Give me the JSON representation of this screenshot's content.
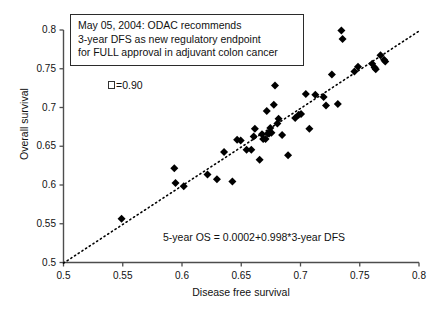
{
  "chart_data": {
    "type": "scatter",
    "title": "",
    "xlabel": "Disease free survival",
    "ylabel": "Overall survival",
    "xlim": [
      0.5,
      0.8
    ],
    "ylim": [
      0.5,
      0.8
    ],
    "xticks": [
      "0.5",
      "0.55",
      "0.6",
      "0.65",
      "0.7",
      "0.75",
      "0.8"
    ],
    "yticks": [
      "0.5",
      "0.55",
      "0.6",
      "0.65",
      "0.7",
      "0.75",
      "0.8"
    ],
    "xtick_values": [
      0.5,
      0.55,
      0.6,
      0.65,
      0.7,
      0.75,
      0.8
    ],
    "ytick_values": [
      0.5,
      0.55,
      0.6,
      0.65,
      0.7,
      0.75,
      0.8
    ],
    "grid": false,
    "legend": "none",
    "marker": "filled-diamond",
    "marker_color": "#000000",
    "trendline": {
      "style": "dotted",
      "color": "#000000",
      "intercept": 0.0002,
      "slope": 0.998,
      "x_start": 0.5,
      "x_end": 0.8
    },
    "series": [
      {
        "name": "Trials",
        "points": [
          [
            0.549,
            0.5565
          ],
          [
            0.5935,
            0.6215
          ],
          [
            0.5945,
            0.6025
          ],
          [
            0.6015,
            0.5985
          ],
          [
            0.6215,
            0.6135
          ],
          [
            0.6295,
            0.6075
          ],
          [
            0.6355,
            0.6425
          ],
          [
            0.6425,
            0.6045
          ],
          [
            0.6465,
            0.6585
          ],
          [
            0.6495,
            0.6575
          ],
          [
            0.6545,
            0.6455
          ],
          [
            0.6585,
            0.6455
          ],
          [
            0.6605,
            0.6625
          ],
          [
            0.6615,
            0.6725
          ],
          [
            0.6655,
            0.6325
          ],
          [
            0.6675,
            0.6655
          ],
          [
            0.6685,
            0.6595
          ],
          [
            0.6705,
            0.6595
          ],
          [
            0.6715,
            0.6955
          ],
          [
            0.6725,
            0.6665
          ],
          [
            0.6735,
            0.6665
          ],
          [
            0.6745,
            0.6735
          ],
          [
            0.6755,
            0.6675
          ],
          [
            0.6775,
            0.7035
          ],
          [
            0.6785,
            0.7285
          ],
          [
            0.6805,
            0.6795
          ],
          [
            0.6815,
            0.6855
          ],
          [
            0.6845,
            0.6645
          ],
          [
            0.6895,
            0.6385
          ],
          [
            0.6955,
            0.6865
          ],
          [
            0.6985,
            0.6905
          ],
          [
            0.7005,
            0.6915
          ],
          [
            0.7045,
            0.7175
          ],
          [
            0.7075,
            0.6725
          ],
          [
            0.7125,
            0.7165
          ],
          [
            0.7195,
            0.7135
          ],
          [
            0.7215,
            0.7025
          ],
          [
            0.7265,
            0.7425
          ],
          [
            0.7315,
            0.7045
          ],
          [
            0.7345,
            0.7995
          ],
          [
            0.7355,
            0.7885
          ],
          [
            0.7455,
            0.7465
          ],
          [
            0.7485,
            0.7525
          ],
          [
            0.7605,
            0.7565
          ],
          [
            0.7625,
            0.7515
          ],
          [
            0.7635,
            0.7495
          ],
          [
            0.7675,
            0.7675
          ],
          [
            0.7705,
            0.7615
          ],
          [
            0.7715,
            0.7595
          ]
        ]
      }
    ],
    "annotations": {
      "note_box": {
        "lines": [
          "May 05, 2004: ODAC recommends",
          "3-year DFS as new regulatory endpoint",
          "for FULL approval in adjuvant colon cancer"
        ]
      },
      "correlation": {
        "symbol": "□",
        "text": "=0.90"
      },
      "equation": "5-year OS = 0.0002+0.998*3-year DFS"
    }
  }
}
